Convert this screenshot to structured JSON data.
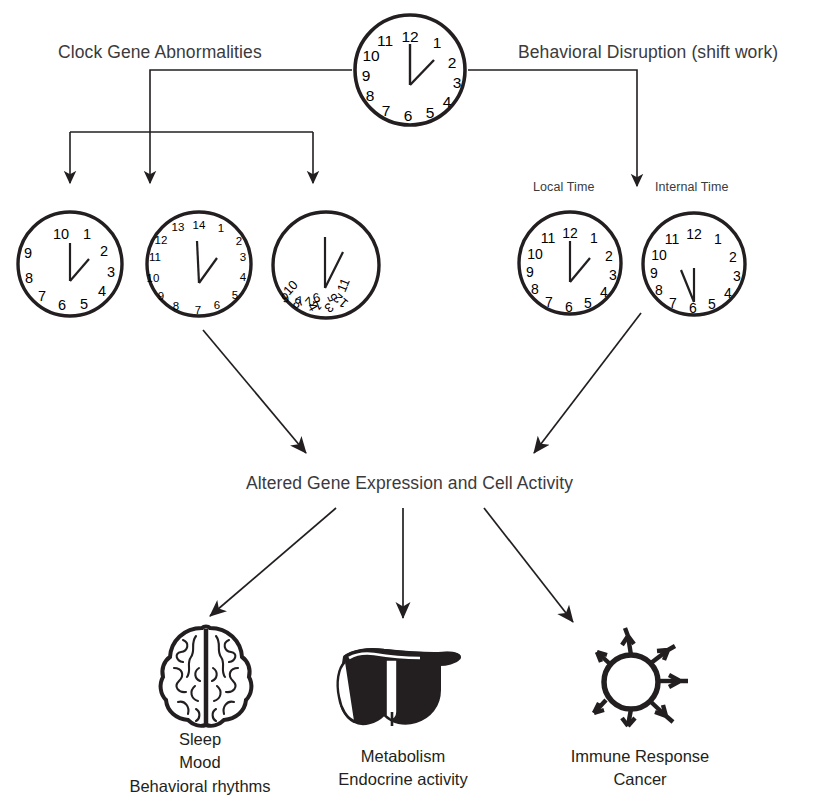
{
  "diagram": {
    "title_top_left": "Clock Gene Abnormalities",
    "title_top_right": "Behavioral Disruption (shift work)",
    "center_node": "Altered Gene Expression and Cell Activity",
    "sub_labels": {
      "local_time": "Local Time",
      "internal_time": "Internal Time"
    },
    "outcomes": [
      {
        "icon": "brain-icon",
        "lines": [
          "Sleep",
          "Mood",
          "Behavioral rhythms"
        ]
      },
      {
        "icon": "liver-icon",
        "lines": [
          "Metabolism",
          "Endocrine activity"
        ]
      },
      {
        "icon": "immune-cell-icon",
        "lines": [
          "Immune Response",
          "Cancer"
        ]
      }
    ],
    "clocks": [
      {
        "id": "master-clock",
        "role": "master",
        "numerals": [
          "12",
          "1",
          "2",
          "3",
          "4",
          "5",
          "6",
          "7",
          "8",
          "9",
          "10",
          "11"
        ],
        "hour_hand": "2",
        "minute_hand": "12"
      },
      {
        "id": "abnormal-clock-1",
        "role": "clock-gene-abnormality",
        "numerals": [
          "10",
          "1",
          "2",
          "3",
          "4",
          "5",
          "6",
          "7",
          "8",
          "9"
        ],
        "hour_hand": "2",
        "minute_hand": "10"
      },
      {
        "id": "abnormal-clock-2",
        "role": "clock-gene-abnormality",
        "numerals": [
          "14",
          "1",
          "2",
          "3",
          "4",
          "5",
          "6",
          "7",
          "8",
          "9",
          "10",
          "11",
          "12",
          "13"
        ],
        "hour_hand": "2",
        "minute_hand": "14"
      },
      {
        "id": "abnormal-clock-3",
        "role": "clock-gene-abnormality",
        "numerals": [
          "11",
          "12",
          "1",
          "2",
          "3",
          "4",
          "5",
          "6",
          "7",
          "8",
          "9",
          "10"
        ],
        "numerals_scrambled": true,
        "hour_hand": "6",
        "minute_hand": "12"
      },
      {
        "id": "local-time-clock",
        "role": "behavioral-disruption",
        "numerals": [
          "12",
          "1",
          "2",
          "3",
          "4",
          "5",
          "6",
          "7",
          "8",
          "9",
          "10",
          "11"
        ],
        "hour_hand": "2",
        "minute_hand": "12"
      },
      {
        "id": "internal-time-clock",
        "role": "behavioral-disruption",
        "numerals": [
          "12",
          "1",
          "2",
          "3",
          "4",
          "5",
          "6",
          "7",
          "8",
          "9",
          "10",
          "11"
        ],
        "hour_hand": "11",
        "minute_hand": "6"
      }
    ],
    "colors": {
      "stroke": "#231f20",
      "text": "#3b3a3c",
      "background": "#ffffff"
    }
  }
}
